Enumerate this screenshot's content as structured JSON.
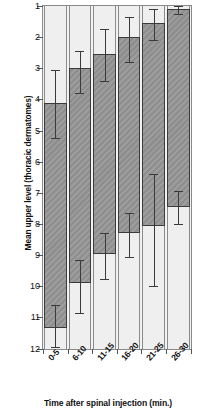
{
  "chart_data": {
    "type": "bar",
    "title": "",
    "xlabel": "Time after spinal injection (min.)",
    "ylabel": "Mean upper level (thoracic dermatomes)",
    "categories": [
      "0-5",
      "6-10",
      "11-15",
      "16-20",
      "21-25",
      "26-30"
    ],
    "ylim": [
      1,
      12
    ],
    "y_inverted": true,
    "yticks": [
      1,
      2,
      3,
      4,
      5,
      6,
      7,
      8,
      9,
      10,
      11,
      12
    ],
    "ytick_labels": [
      "1",
      "2",
      "3",
      "4",
      "5",
      "6",
      "7",
      "8",
      "9",
      "10",
      "11",
      "12"
    ],
    "grid": false,
    "legend": null,
    "series": [
      {
        "name": "Mean upper level",
        "values": [
          4.1,
          3.0,
          2.55,
          2.0,
          1.55,
          1.1
        ],
        "error_low": [
          3.05,
          2.45,
          1.75,
          1.35,
          1.1,
          1.0
        ],
        "error_high": [
          5.25,
          3.8,
          3.4,
          2.8,
          2.1,
          1.25
        ]
      },
      {
        "name": "Mean lower level",
        "values": [
          11.35,
          9.9,
          8.95,
          8.3,
          8.05,
          7.45
        ],
        "error_low": [
          10.6,
          9.15,
          8.3,
          7.65,
          6.4,
          6.95
        ],
        "error_high": [
          11.95,
          10.85,
          9.75,
          9.05,
          10.0,
          8.0
        ]
      }
    ],
    "bar_fill": "#959595",
    "bar_edge": "#3b3b3b",
    "panel_background": "#f2f2f2",
    "axis_color": "#8a8a8a"
  }
}
